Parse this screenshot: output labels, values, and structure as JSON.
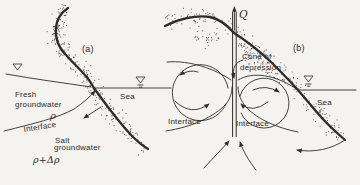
{
  "figure": {
    "colors": {
      "background": "#f4f3ef",
      "ink": "#2e2c29"
    },
    "panel_a": {
      "tag": "(a)",
      "labels": {
        "fresh1": "Fresh",
        "fresh2": "groundwater",
        "rho": "ρ",
        "interface": "Interface",
        "sea": "Sea",
        "salt1": "Salt",
        "salt2": "groundwater",
        "density": "ρ+Δρ"
      },
      "icons": {
        "water_level_symbol": "▽"
      }
    },
    "panel_b": {
      "tag": "(b)",
      "labels": {
        "discharge": "Q",
        "cone1": "Cone of",
        "cone2": "depression",
        "interface_left": "Interface",
        "interface_right": "Interface",
        "sea": "Sea"
      },
      "icons": {
        "water_level_symbol": "▽"
      }
    }
  }
}
